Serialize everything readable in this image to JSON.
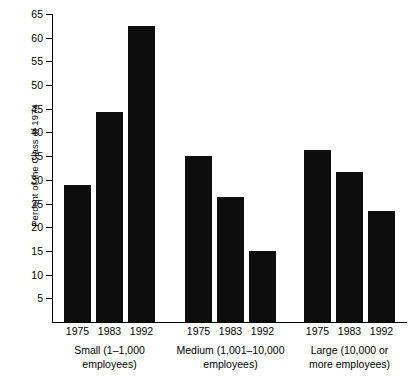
{
  "chart_data": {
    "type": "bar",
    "title": "",
    "xlabel": "",
    "ylabel": "Percent of the Class of 1974",
    "ylim": [
      0,
      65
    ],
    "ytick_step": 5,
    "yticks": [
      5,
      10,
      15,
      20,
      25,
      30,
      35,
      40,
      45,
      50,
      55,
      60,
      65
    ],
    "grid": false,
    "legend": "none",
    "bar_color": "#0d0d0d",
    "categories": [
      "1975",
      "1983",
      "1992"
    ],
    "groups": [
      {
        "name": "Small",
        "label_lines": [
          "Small (1–1,000",
          "employees)"
        ],
        "values": [
          29,
          44.3,
          62.5
        ]
      },
      {
        "name": "Medium",
        "label_lines": [
          "Medium (1,001–10,000",
          "employees)"
        ],
        "values": [
          35,
          26.4,
          15
        ]
      },
      {
        "name": "Large",
        "label_lines": [
          "Large (10,000 or",
          "more employees)"
        ],
        "values": [
          36.4,
          31.6,
          23.4
        ]
      }
    ]
  }
}
